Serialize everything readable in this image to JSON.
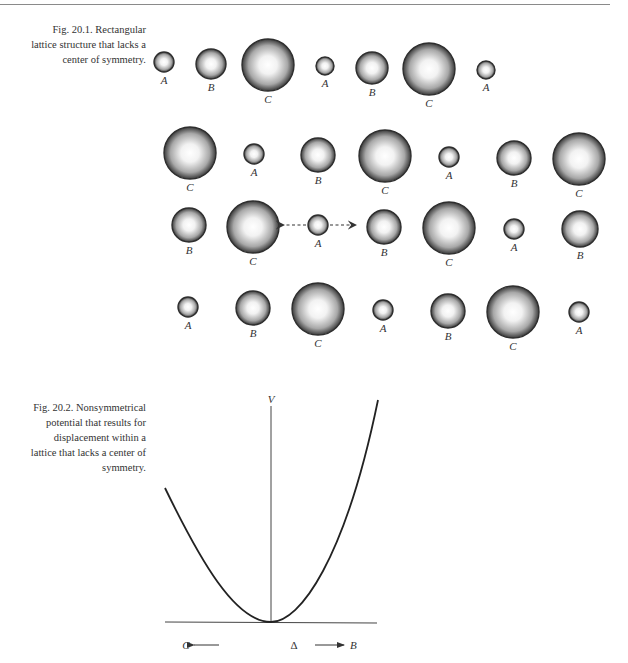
{
  "figure_1": {
    "caption_lines": [
      "Fig. 20.1.  Rectangular",
      "lattice structure that lacks a",
      "center of symmetry."
    ],
    "rows": [
      {
        "atoms": [
          {
            "label": "A",
            "x": 164,
            "y": 62,
            "r": 10
          },
          {
            "label": "B",
            "x": 211,
            "y": 64,
            "r": 15
          },
          {
            "label": "C",
            "x": 268,
            "y": 65,
            "r": 26
          },
          {
            "label": "A",
            "x": 325,
            "y": 66,
            "r": 9
          },
          {
            "label": "B",
            "x": 372,
            "y": 68,
            "r": 16
          },
          {
            "label": "C",
            "x": 429,
            "y": 69,
            "r": 26
          },
          {
            "label": "A",
            "x": 486,
            "y": 70,
            "r": 9
          }
        ]
      },
      {
        "atoms": [
          {
            "label": "C",
            "x": 190,
            "y": 153,
            "r": 26
          },
          {
            "label": "A",
            "x": 254,
            "y": 154,
            "r": 10
          },
          {
            "label": "B",
            "x": 318,
            "y": 155,
            "r": 17
          },
          {
            "label": "C",
            "x": 385,
            "y": 156,
            "r": 26
          },
          {
            "label": "A",
            "x": 449,
            "y": 157,
            "r": 10
          },
          {
            "label": "B",
            "x": 514,
            "y": 158,
            "r": 17
          },
          {
            "label": "C",
            "x": 579,
            "y": 159,
            "r": 26
          }
        ]
      },
      {
        "atoms": [
          {
            "label": "B",
            "x": 189,
            "y": 225,
            "r": 17
          },
          {
            "label": "C",
            "x": 253,
            "y": 227,
            "r": 26
          },
          {
            "label": "A",
            "x": 318,
            "y": 225,
            "r": 10
          },
          {
            "label": "B",
            "x": 384,
            "y": 227,
            "r": 17
          },
          {
            "label": "C",
            "x": 449,
            "y": 228,
            "r": 26
          },
          {
            "label": "A",
            "x": 514,
            "y": 229,
            "r": 10
          },
          {
            "label": "B",
            "x": 580,
            "y": 229,
            "r": 18
          }
        ]
      },
      {
        "atoms": [
          {
            "label": "A",
            "x": 188,
            "y": 307,
            "r": 10
          },
          {
            "label": "B",
            "x": 253,
            "y": 308,
            "r": 17
          },
          {
            "label": "C",
            "x": 318,
            "y": 309,
            "r": 26
          },
          {
            "label": "A",
            "x": 383,
            "y": 310,
            "r": 10
          },
          {
            "label": "B",
            "x": 448,
            "y": 311,
            "r": 17
          },
          {
            "label": "C",
            "x": 513,
            "y": 312,
            "r": 26
          },
          {
            "label": "A",
            "x": 579,
            "y": 312,
            "r": 10
          }
        ]
      }
    ],
    "displacement_arrows": {
      "atom": "A",
      "row": 3,
      "directions": [
        "toward C (left)",
        "toward B (right)"
      ],
      "style": "dashed"
    }
  },
  "figure_2": {
    "caption_lines": [
      "Fig. 20.2.  Nonsymmetrical",
      "potential that results for",
      "displacement within a",
      "lattice that lacks a center of",
      "symmetry."
    ],
    "y_axis_label": "V",
    "x_axis_label": "Δ",
    "left_direction_label": "C",
    "right_direction_label": "B",
    "curve": "asymmetric potential well: shallower rise toward C (left), steeper rise toward B (right), minimum at Δ = 0"
  }
}
